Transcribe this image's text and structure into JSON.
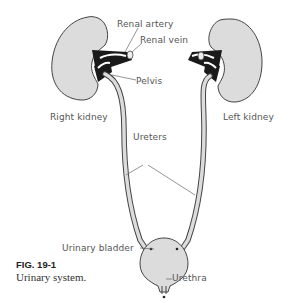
{
  "figure": {
    "number": "FIG. 19-1",
    "caption": "Urinary system."
  },
  "labels": {
    "renal_artery": "Renal artery",
    "renal_vein": "Renal vein",
    "pelvis": "Pelvis",
    "right_kidney": "Right kidney",
    "left_kidney": "Left kidney",
    "ureters": "Ureters",
    "urinary_bladder": "Urinary bladder",
    "urethra": "Urethra"
  },
  "colors": {
    "organ_fill": "#dcdcdc",
    "outline": "#444444",
    "vessels": "#1a1a1a",
    "leader_lines": "#666666"
  }
}
